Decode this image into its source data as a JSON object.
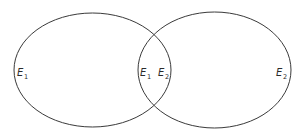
{
  "diagram": {
    "type": "venn",
    "stroke_color": "#3a3a3a",
    "sets": [
      {
        "name": "E1",
        "base": "E",
        "sub": "1"
      },
      {
        "name": "E2",
        "base": "E",
        "sub": "2"
      }
    ],
    "labels": {
      "left_only": {
        "base": "E",
        "sub": "1"
      },
      "intersection_left": {
        "base": "E",
        "sub": "1"
      },
      "intersection_right": {
        "base": "E",
        "sub": "2"
      },
      "right_only": {
        "base": "E",
        "sub": "2"
      }
    }
  }
}
